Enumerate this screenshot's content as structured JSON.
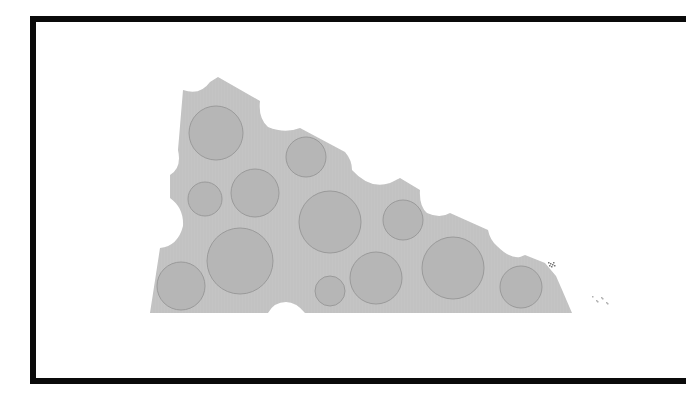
{
  "canvas": {
    "width": 665,
    "height": 399,
    "background": "#ffffff"
  },
  "frame": {
    "border_color": "#0a0a0a",
    "border_width": 6
  },
  "cheese": {
    "label": "",
    "fill": "#c4c4c4",
    "hole_fill": "#b6b6b6",
    "hole_stroke": "#9a9a9a",
    "outline_path": "M183,90 Q200,96 210,82 L218,77 L260,101 Q258,118 268,127 Q285,134 300,128 L345,152 Q352,160 352,170 Q370,190 390,183 Q398,179 400,178 L420,190 Q419,206 427,213 Q440,219 450,213 L488,230 Q490,240 497,246 Q510,259 520,257 L525,255 L545,263 L556,276 L563,292 L572,313 L305,313 Q296,302 286,302 Q274,302 268,313 L150,313 L160,248 Q178,246 183,226 Q184,208 170,198 L170,175 Q182,168 178,150 Z",
    "holes": [
      {
        "cx": 216,
        "cy": 133,
        "r": 27
      },
      {
        "cx": 306,
        "cy": 157,
        "r": 20
      },
      {
        "cx": 205,
        "cy": 199,
        "r": 17
      },
      {
        "cx": 255,
        "cy": 193,
        "r": 24
      },
      {
        "cx": 330,
        "cy": 222,
        "r": 31
      },
      {
        "cx": 403,
        "cy": 220,
        "r": 20
      },
      {
        "cx": 240,
        "cy": 261,
        "r": 33
      },
      {
        "cx": 181,
        "cy": 286,
        "r": 24
      },
      {
        "cx": 330,
        "cy": 291,
        "r": 15
      },
      {
        "cx": 376,
        "cy": 278,
        "r": 26
      },
      {
        "cx": 453,
        "cy": 268,
        "r": 31
      },
      {
        "cx": 521,
        "cy": 287,
        "r": 21
      }
    ]
  },
  "specks": [
    {
      "x": 548,
      "y": 262,
      "w": 9,
      "h": 5,
      "color": "#777777"
    },
    {
      "x": 592,
      "y": 296,
      "w": 16,
      "h": 8,
      "color": "#b0b0b0"
    }
  ]
}
